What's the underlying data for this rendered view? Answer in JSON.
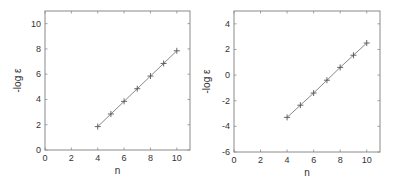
{
  "chart_data": [
    {
      "type": "line",
      "title": "",
      "xlabel": "n",
      "ylabel": "-log ε",
      "xlim": [
        0,
        11
      ],
      "ylim": [
        0,
        11
      ],
      "xticks": [
        0,
        2,
        4,
        6,
        8,
        10
      ],
      "yticks": [
        0,
        2,
        4,
        6,
        8,
        10
      ],
      "xtick_labels": [
        "0",
        "2",
        "4",
        "6",
        "8",
        "10"
      ],
      "ytick_labels": [
        "0",
        "2",
        "4",
        "6",
        "8",
        "10"
      ],
      "grid": false,
      "marker": "+",
      "series": [
        {
          "name": "left",
          "x": [
            4,
            5,
            6,
            7,
            8,
            9,
            10
          ],
          "y": [
            1.85,
            2.85,
            3.85,
            4.85,
            5.85,
            6.85,
            7.85
          ]
        }
      ]
    },
    {
      "type": "line",
      "title": "",
      "xlabel": "n",
      "ylabel": "-log ε",
      "xlim": [
        0,
        11
      ],
      "ylim": [
        -6,
        5
      ],
      "xticks": [
        0,
        2,
        4,
        6,
        8,
        10
      ],
      "yticks": [
        -6,
        -4,
        -2,
        0,
        2,
        4
      ],
      "xtick_labels": [
        "0",
        "2",
        "4",
        "6",
        "8",
        "10"
      ],
      "ytick_labels": [
        "-6",
        "-4",
        "-2",
        "0",
        "2",
        "4"
      ],
      "grid": false,
      "marker": "+",
      "series": [
        {
          "name": "right",
          "x": [
            4,
            5,
            6,
            7,
            8,
            9,
            10
          ],
          "y": [
            -3.3,
            -2.35,
            -1.4,
            -0.4,
            0.6,
            1.55,
            2.5
          ]
        }
      ]
    }
  ]
}
